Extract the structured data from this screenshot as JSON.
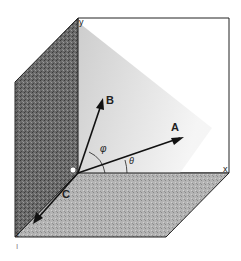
{
  "figure": {
    "axes": {
      "x": "x",
      "y": "y",
      "z": "z"
    },
    "vectors": [
      {
        "name": "A",
        "label": "A"
      },
      {
        "name": "B",
        "label": "B"
      },
      {
        "name": "C",
        "label": "C"
      }
    ],
    "angles": {
      "phi": "φ",
      "theta": "θ"
    },
    "origin_marker": "origin-circle",
    "footer_mark": "I",
    "colors": {
      "ink": "#1a1a1a",
      "wall_dark": "#5a5a5a",
      "floor": "#a8a8a8",
      "back_plane": "#d8d8d8"
    }
  }
}
